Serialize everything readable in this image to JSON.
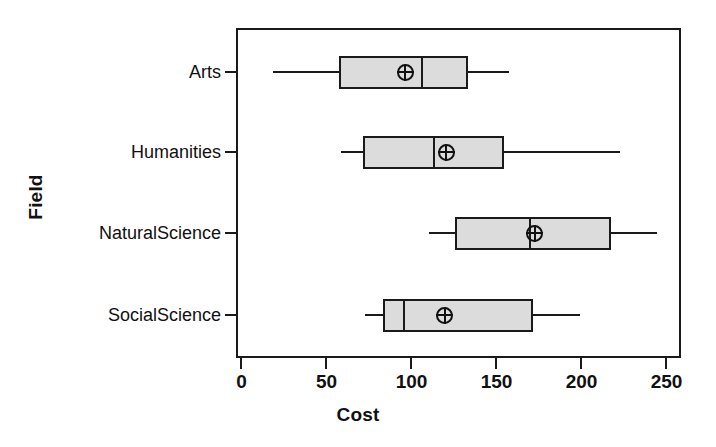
{
  "chart_data": {
    "type": "box",
    "title": "",
    "xlabel": "Cost",
    "ylabel": "Field",
    "xlim": [
      0,
      260
    ],
    "ylim_categories": [
      "SocialScience",
      "NaturalScience",
      "Humanities",
      "Arts"
    ],
    "grid": false,
    "legend": "none",
    "orientation": "horizontal",
    "xticks": [
      {
        "value": 0,
        "label": "0"
      },
      {
        "value": 50,
        "label": "50"
      },
      {
        "value": 100,
        "label": "100"
      },
      {
        "value": 150,
        "label": "150"
      },
      {
        "value": 200,
        "label": "200"
      },
      {
        "value": 250,
        "label": "250"
      }
    ],
    "categories": [
      "Arts",
      "Humanities",
      "NaturalScience",
      "SocialScience"
    ],
    "boxes": [
      {
        "category": "Arts",
        "lower_whisker": 19,
        "q1": 58,
        "median": 107,
        "q3": 134,
        "upper_whisker": 158,
        "mean": 97
      },
      {
        "category": "Humanities",
        "lower_whisker": 59,
        "q1": 72,
        "median": 114,
        "q3": 155,
        "upper_whisker": 223,
        "mean": 121
      },
      {
        "category": "NaturalScience",
        "lower_whisker": 111,
        "q1": 126,
        "median": 170,
        "q3": 218,
        "upper_whisker": 245,
        "mean": 173
      },
      {
        "category": "SocialScience",
        "lower_whisker": 73,
        "q1": 84,
        "median": 96,
        "q3": 172,
        "upper_whisker": 200,
        "mean": 120
      }
    ],
    "colors": {
      "box_fill": "#dcdcdc",
      "line": "#1a1a1a",
      "text": "#111111",
      "background": "#ffffff"
    },
    "mean_marker_symbol": "circle-plus"
  },
  "axes": {
    "x_title": "Cost",
    "y_title": "Field"
  }
}
